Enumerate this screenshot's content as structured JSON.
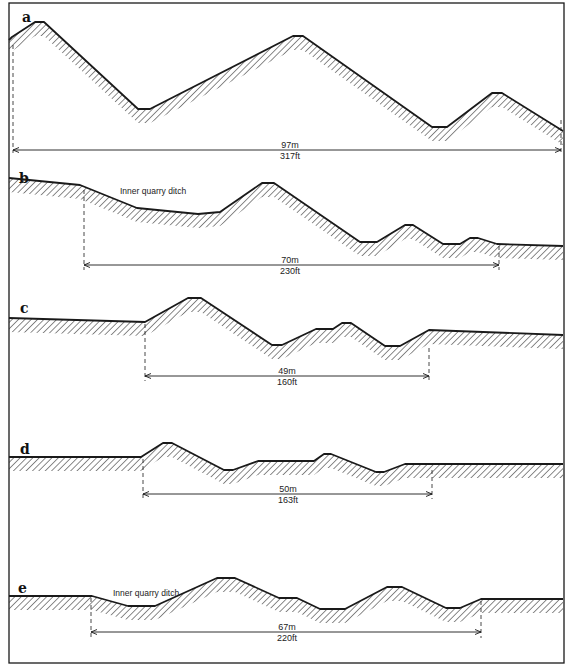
{
  "figure": {
    "width": 568,
    "height": 667,
    "border": {
      "x": 9,
      "y": 3,
      "w": 555,
      "h": 660
    },
    "colors": {
      "ink": "#1a1a1a",
      "hatch": "#2a2a2a",
      "background": "#ffffff"
    }
  },
  "panels": [
    {
      "id": "a",
      "label": "a",
      "label_pos": [
        22,
        22
      ],
      "profile": [
        [
          9,
          40
        ],
        [
          12,
          37
        ],
        [
          35,
          22
        ],
        [
          44,
          22
        ],
        [
          138,
          109
        ],
        [
          150,
          109
        ],
        [
          293,
          36
        ],
        [
          303,
          36
        ],
        [
          432,
          127
        ],
        [
          447,
          127
        ],
        [
          492,
          93
        ],
        [
          502,
          93
        ],
        [
          563,
          131
        ]
      ],
      "hatch_depth": 14,
      "annotation": null,
      "dimension": {
        "x1": 13,
        "x2": 561,
        "y": 150,
        "metric": "97m",
        "imperial": "317ft",
        "text_x": 290,
        "ext_left": [
          13,
          45,
          153
        ],
        "ext_right": [
          561,
          120,
          155
        ]
      }
    },
    {
      "id": "b",
      "label": "b",
      "label_pos": [
        19,
        183
      ],
      "profile": [
        [
          9,
          178
        ],
        [
          80,
          185
        ],
        [
          137,
          208
        ],
        [
          198,
          214
        ],
        [
          220,
          212
        ],
        [
          262,
          183
        ],
        [
          274,
          183
        ],
        [
          360,
          242
        ],
        [
          377,
          242
        ],
        [
          405,
          225
        ],
        [
          413,
          225
        ],
        [
          443,
          244
        ],
        [
          460,
          244
        ],
        [
          470,
          238
        ],
        [
          478,
          238
        ],
        [
          497,
          244
        ],
        [
          563,
          246
        ]
      ],
      "hatch_depth": 14,
      "annotation": {
        "text": "Inner quarry ditch",
        "x": 120,
        "y": 194
      },
      "dimension": {
        "x1": 84,
        "x2": 499,
        "y": 265,
        "metric": "70m",
        "imperial": "230ft",
        "text_x": 290,
        "ext_left": [
          84,
          190,
          270
        ],
        "ext_right": [
          499,
          246,
          270
        ]
      }
    },
    {
      "id": "c",
      "label": "c",
      "label_pos": [
        20,
        313
      ],
      "profile": [
        [
          9,
          318
        ],
        [
          145,
          322
        ],
        [
          188,
          298
        ],
        [
          201,
          298
        ],
        [
          272,
          345
        ],
        [
          282,
          345
        ],
        [
          316,
          329
        ],
        [
          333,
          329
        ],
        [
          342,
          323
        ],
        [
          351,
          323
        ],
        [
          385,
          346
        ],
        [
          400,
          346
        ],
        [
          429,
          330
        ],
        [
          563,
          335
        ]
      ],
      "hatch_depth": 14,
      "annotation": null,
      "dimension": {
        "x1": 145,
        "x2": 429,
        "y": 376,
        "metric": "49m",
        "imperial": "160ft",
        "text_x": 287,
        "ext_left": [
          145,
          324,
          381
        ],
        "ext_right": [
          429,
          348,
          381
        ]
      }
    },
    {
      "id": "d",
      "label": "d",
      "label_pos": [
        20,
        454
      ],
      "profile": [
        [
          9,
          457
        ],
        [
          141,
          457
        ],
        [
          163,
          443
        ],
        [
          172,
          443
        ],
        [
          224,
          470
        ],
        [
          233,
          470
        ],
        [
          258,
          461
        ],
        [
          314,
          461
        ],
        [
          324,
          454
        ],
        [
          331,
          454
        ],
        [
          376,
          472
        ],
        [
          384,
          472
        ],
        [
          405,
          464
        ],
        [
          563,
          464
        ]
      ],
      "hatch_depth": 14,
      "annotation": null,
      "dimension": {
        "x1": 143,
        "x2": 432,
        "y": 494,
        "metric": "50m",
        "imperial": "163ft",
        "text_x": 288,
        "ext_left": [
          143,
          459,
          499
        ],
        "ext_right": [
          432,
          470,
          499
        ]
      }
    },
    {
      "id": "e",
      "label": "e",
      "label_pos": [
        18,
        593
      ],
      "profile": [
        [
          9,
          596
        ],
        [
          92,
          596
        ],
        [
          128,
          606
        ],
        [
          155,
          606
        ],
        [
          217,
          578
        ],
        [
          235,
          578
        ],
        [
          279,
          598
        ],
        [
          297,
          598
        ],
        [
          320,
          609
        ],
        [
          345,
          609
        ],
        [
          387,
          587
        ],
        [
          402,
          587
        ],
        [
          446,
          608
        ],
        [
          460,
          608
        ],
        [
          481,
          599
        ],
        [
          563,
          599
        ]
      ],
      "hatch_depth": 14,
      "annotation": {
        "text": "Inner quarry ditch",
        "x": 113,
        "y": 596
      },
      "dimension": {
        "x1": 91,
        "x2": 481,
        "y": 632,
        "metric": "67m",
        "imperial": "220ft",
        "text_x": 287,
        "ext_left": [
          91,
          598,
          638
        ],
        "ext_right": [
          481,
          601,
          638
        ]
      }
    }
  ]
}
